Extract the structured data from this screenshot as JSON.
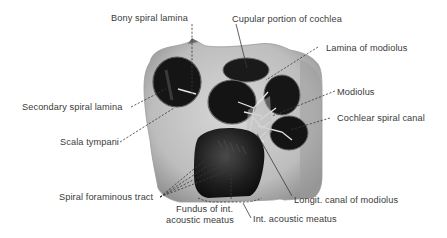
{
  "figure": {
    "colors": {
      "background": "#ffffff",
      "bone_light": "#cfcfcf",
      "bone_mid": "#a9a9a9",
      "cavity_dark": "#151515",
      "label_text": "#3a3a3a",
      "leader_line": "#3a3a3a"
    },
    "labels": [
      {
        "id": "bony-spiral-lamina",
        "text": "Bony spiral lamina"
      },
      {
        "id": "cupular-portion",
        "text": "Cupular portion of cochlea"
      },
      {
        "id": "lamina-of-modiolus",
        "text": "Lamina of modiolus"
      },
      {
        "id": "secondary-spiral-lamina",
        "text": "Secondary spiral lamina"
      },
      {
        "id": "modiolus",
        "text": "Modiolus"
      },
      {
        "id": "cochlear-spiral-canal",
        "text": "Cochlear spiral canal"
      },
      {
        "id": "scala-tympani",
        "text": "Scala tympani"
      },
      {
        "id": "spiral-foraminous-tract",
        "text": "Spiral foraminous tract"
      },
      {
        "id": "longit-canal",
        "text": "Longit. canal of modiolus"
      },
      {
        "id": "fundus-line1",
        "text": "Fundus of int."
      },
      {
        "id": "fundus-line2",
        "text": "acoustic meatus"
      },
      {
        "id": "int-acoustic-meatus",
        "text": "Int. acoustic meatus"
      }
    ]
  }
}
